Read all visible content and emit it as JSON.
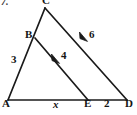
{
  "figure": {
    "problem_number": "7.",
    "type": "geometry-diagram",
    "stroke_color": "#1a1a1a",
    "background_color": "#ffffff",
    "vertices": [
      {
        "name": "C",
        "label": "C",
        "x": 45,
        "y": 8
      },
      {
        "name": "B",
        "label": "B",
        "x": 35,
        "y": 38
      },
      {
        "name": "A",
        "label": "A",
        "x": 8,
        "y": 100
      },
      {
        "name": "E",
        "label": "E",
        "x": 88,
        "y": 100
      },
      {
        "name": "D",
        "label": "D",
        "x": 127,
        "y": 100
      }
    ],
    "segments": [
      {
        "name": "segment-AC",
        "from": "A",
        "to": "C"
      },
      {
        "name": "segment-CD",
        "from": "C",
        "to": "D"
      },
      {
        "name": "segment-AD",
        "from": "A",
        "to": "D"
      },
      {
        "name": "segment-BE",
        "from": "B",
        "to": "E"
      }
    ],
    "parallel_marks": [
      {
        "name": "arrow-mark-BE",
        "on": "segment-BE",
        "x": 57,
        "y": 60
      },
      {
        "name": "arrow-mark-CD",
        "on": "segment-CD",
        "x": 85,
        "y": 38
      }
    ],
    "measures": {
      "AB": "3",
      "BE": "4",
      "CD": "6",
      "AE": "x",
      "ED": "2"
    }
  }
}
